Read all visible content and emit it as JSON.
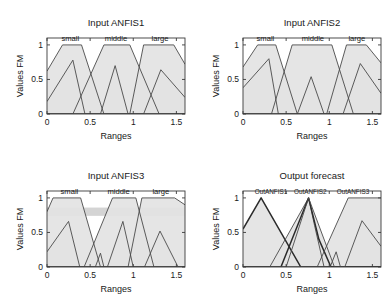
{
  "figure": {
    "background": "#ffffff",
    "panel_count": 4,
    "line_color": "#4a4a4a",
    "fill_color": "#e3e3e3",
    "dark_line_color": "#2b2b2b"
  },
  "panels": [
    {
      "id": "input-anfis1",
      "title": "Input ANFIS1",
      "xlabel": "Ranges",
      "ylabel": "Values FM",
      "xticks": [
        "0",
        "0.5",
        "1",
        "1.5"
      ],
      "yticks": [
        "0",
        "0.5",
        "1"
      ],
      "mf_labels": [
        {
          "text": "small",
          "x": 0.27
        },
        {
          "text": "middle",
          "x": 0.8
        },
        {
          "text": "large",
          "x": 1.31
        }
      ]
    },
    {
      "id": "input-anfis2",
      "title": "Input ANFIS2",
      "xlabel": "Ranges",
      "ylabel": "Values FM",
      "xticks": [
        "0",
        "0.5",
        "1",
        "1.5"
      ],
      "yticks": [
        "0",
        "0.5",
        "1"
      ],
      "mf_labels": [
        {
          "text": "small",
          "x": 0.26
        },
        {
          "text": "middle",
          "x": 0.81
        },
        {
          "text": "large",
          "x": 1.32
        }
      ]
    },
    {
      "id": "input-anfis3",
      "title": "Input ANFIS3",
      "xlabel": "Ranges",
      "ylabel": "Values FM",
      "xticks": [
        "0",
        "0.5",
        "1",
        "1.5"
      ],
      "yticks": [
        "0",
        "0.5",
        "1"
      ],
      "mf_labels": [
        {
          "text": "small",
          "x": 0.26
        },
        {
          "text": "middle",
          "x": 0.83
        },
        {
          "text": "large",
          "x": 1.32
        }
      ]
    },
    {
      "id": "output-forecast",
      "title": "Output forecast",
      "xlabel": "Ranges",
      "ylabel": "Values FM",
      "xticks": [
        "0",
        "0.5",
        "1",
        "1.5"
      ],
      "yticks": [
        "0",
        "0.5",
        "1"
      ],
      "mf_labels": [
        {
          "text": "OutANFIS1",
          "x": 0.21
        },
        {
          "text": "OutANFIS2",
          "x": 0.78
        },
        {
          "text": "OutANFIS3",
          "x": 1.36
        }
      ]
    }
  ],
  "chart_data": {
    "type": "line",
    "xlabel": "Ranges",
    "ylabel": "Values FM",
    "xlim": [
      0,
      1.6
    ],
    "ylim": [
      0,
      1.1
    ],
    "xticks": [
      0,
      0.5,
      1,
      1.5
    ],
    "yticks": [
      0,
      0.5,
      1
    ],
    "grid": false,
    "legend": "none",
    "subplots": [
      {
        "name": "Input ANFIS1",
        "series": [
          {
            "name": "small",
            "label_x": 0.27,
            "points": [
              [
                0,
                0.62
              ],
              [
                0.18,
                1.0
              ],
              [
                0.4,
                1.0
              ],
              [
                0.66,
                0.0
              ],
              [
                1.6,
                0.0
              ]
            ]
          },
          {
            "name": "small-lower",
            "label_x": null,
            "points": [
              [
                0,
                0.18
              ],
              [
                0.3,
                0.78
              ],
              [
                0.44,
                0.0
              ],
              [
                1.6,
                0.0
              ]
            ]
          },
          {
            "name": "middle",
            "label_x": 0.8,
            "points": [
              [
                0,
                0.0
              ],
              [
                0.3,
                0.0
              ],
              [
                0.66,
                1.0
              ],
              [
                0.96,
                1.0
              ],
              [
                1.3,
                0.0
              ],
              [
                1.6,
                0.0
              ]
            ]
          },
          {
            "name": "middle-lower",
            "label_x": null,
            "points": [
              [
                0,
                0.0
              ],
              [
                0.62,
                0.0
              ],
              [
                0.79,
                0.7
              ],
              [
                0.94,
                0.0
              ],
              [
                1.6,
                0.0
              ]
            ]
          },
          {
            "name": "large",
            "label_x": 1.31,
            "points": [
              [
                0,
                0.0
              ],
              [
                0.96,
                0.0
              ],
              [
                1.12,
                1.0
              ],
              [
                1.47,
                1.0
              ],
              [
                1.6,
                0.72
              ]
            ]
          },
          {
            "name": "large-lower",
            "label_x": null,
            "points": [
              [
                0,
                0.0
              ],
              [
                1.12,
                0.0
              ],
              [
                1.32,
                0.64
              ],
              [
                1.6,
                0.24
              ]
            ]
          }
        ]
      },
      {
        "name": "Input ANFIS2",
        "series": [
          {
            "name": "small",
            "label_x": 0.26,
            "points": [
              [
                0,
                0.68
              ],
              [
                0.17,
                1.0
              ],
              [
                0.38,
                1.0
              ],
              [
                0.63,
                0.0
              ],
              [
                1.6,
                0.0
              ]
            ]
          },
          {
            "name": "small-lower",
            "label_x": null,
            "points": [
              [
                0,
                0.38
              ],
              [
                0.3,
                0.8
              ],
              [
                0.41,
                0.0
              ],
              [
                1.6,
                0.0
              ]
            ]
          },
          {
            "name": "middle",
            "label_x": 0.81,
            "points": [
              [
                0,
                0.0
              ],
              [
                0.33,
                0.0
              ],
              [
                0.57,
                1.0
              ],
              [
                1.03,
                1.0
              ],
              [
                1.28,
                0.0
              ],
              [
                1.6,
                0.0
              ]
            ]
          },
          {
            "name": "middle-lower",
            "label_x": null,
            "points": [
              [
                0,
                0.0
              ],
              [
                0.63,
                0.0
              ],
              [
                0.79,
                0.54
              ],
              [
                0.94,
                0.0
              ],
              [
                1.6,
                0.0
              ]
            ]
          },
          {
            "name": "large",
            "label_x": 1.32,
            "points": [
              [
                0,
                0.0
              ],
              [
                0.97,
                0.0
              ],
              [
                1.2,
                1.0
              ],
              [
                1.43,
                1.0
              ],
              [
                1.6,
                0.74
              ]
            ]
          },
          {
            "name": "large-lower",
            "label_x": null,
            "points": [
              [
                0,
                0.0
              ],
              [
                1.16,
                0.0
              ],
              [
                1.36,
                0.73
              ],
              [
                1.6,
                0.3
              ]
            ]
          }
        ]
      },
      {
        "name": "Input ANFIS3",
        "series": [
          {
            "name": "small",
            "label_x": 0.26,
            "points": [
              [
                0,
                0.8
              ],
              [
                0.07,
                1.0
              ],
              [
                0.39,
                1.0
              ],
              [
                0.62,
                0.0
              ],
              [
                1.6,
                0.0
              ]
            ]
          },
          {
            "name": "small-lower",
            "label_x": null,
            "points": [
              [
                0,
                0.22
              ],
              [
                0.25,
                0.66
              ],
              [
                0.38,
                0.0
              ],
              [
                1.6,
                0.0
              ]
            ]
          },
          {
            "name": "middle",
            "label_x": 0.83,
            "points": [
              [
                0,
                0.0
              ],
              [
                0.43,
                0.0
              ],
              [
                0.76,
                1.0
              ],
              [
                1.03,
                1.0
              ],
              [
                1.24,
                0.0
              ],
              [
                1.6,
                0.0
              ]
            ]
          },
          {
            "name": "middle-lower",
            "label_x": null,
            "points": [
              [
                0,
                0.0
              ],
              [
                0.56,
                0.0
              ],
              [
                0.62,
                0.2
              ],
              [
                0.66,
                0.0
              ],
              [
                0.7,
                0.0
              ],
              [
                0.88,
                0.66
              ],
              [
                1.0,
                0.0
              ],
              [
                1.6,
                0.0
              ]
            ]
          },
          {
            "name": "large",
            "label_x": 1.32,
            "points": [
              [
                0,
                0.0
              ],
              [
                0.94,
                0.0
              ],
              [
                1.1,
                1.0
              ],
              [
                1.48,
                1.0
              ],
              [
                1.6,
                0.9
              ]
            ]
          },
          {
            "name": "large-lower",
            "label_x": null,
            "points": [
              [
                0,
                0.0
              ],
              [
                1.13,
                0.0
              ],
              [
                1.31,
                0.52
              ],
              [
                1.52,
                0.0
              ],
              [
                1.6,
                0.0
              ]
            ]
          }
        ],
        "band": {
          "y_low": 0.74,
          "y_high": 0.86,
          "color": "#d2d2d2"
        }
      },
      {
        "name": "Output forecast",
        "series": [
          {
            "name": "OutANFIS1",
            "label_x": 0.21,
            "dark": true,
            "points": [
              [
                0,
                0.55
              ],
              [
                0.21,
                1.0
              ],
              [
                0.67,
                0.0
              ],
              [
                1.6,
                0.0
              ]
            ]
          },
          {
            "name": "OutANFIS1-lower",
            "label_x": null,
            "points": [
              [
                0,
                0.0
              ],
              [
                0.31,
                0.0
              ],
              [
                0.76,
                1.0
              ],
              [
                0.83,
                0.6
              ],
              [
                0.94,
                0.0
              ],
              [
                1.6,
                0.0
              ]
            ]
          },
          {
            "name": "OutANFIS2",
            "label_x": 0.78,
            "dark": true,
            "points": [
              [
                0,
                0.0
              ],
              [
                0.44,
                0.0
              ],
              [
                0.76,
                1.0
              ],
              [
                0.88,
                0.4
              ],
              [
                1.02,
                0.0
              ],
              [
                1.6,
                0.0
              ]
            ]
          },
          {
            "name": "OutANFIS2-lower",
            "label_x": null,
            "points": [
              [
                0,
                0.0
              ],
              [
                0.5,
                0.0
              ],
              [
                0.76,
                1.0
              ],
              [
                1.06,
                0.0
              ],
              [
                1.6,
                0.0
              ]
            ]
          },
          {
            "name": "OutANFIS3",
            "label_x": 1.36,
            "points": [
              [
                0,
                0.0
              ],
              [
                0.86,
                0.0
              ],
              [
                1.22,
                1.0
              ],
              [
                1.6,
                1.0
              ]
            ]
          },
          {
            "name": "OutANFIS3-lower",
            "label_x": null,
            "points": [
              [
                0,
                0.0
              ],
              [
                1.01,
                0.0
              ],
              [
                1.08,
                0.22
              ],
              [
                1.13,
                0.0
              ],
              [
                1.18,
                0.0
              ],
              [
                1.38,
                0.67
              ],
              [
                1.6,
                0.3
              ]
            ]
          }
        ]
      }
    ]
  }
}
